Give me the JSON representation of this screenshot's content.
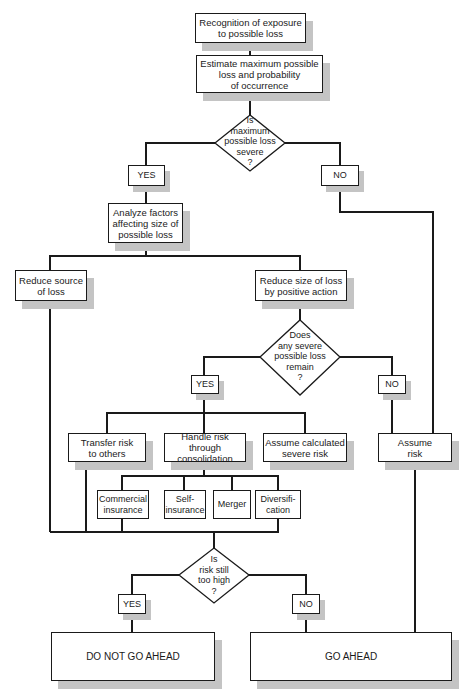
{
  "flowchart": {
    "nodes": {
      "recognition": "Recognition of exposure\nto possible loss",
      "estimate": "Estimate maximum possible\nloss and  probability\nof occurrence",
      "decision_severe": "Is\nmaximum\npossible loss\nsevere\n?",
      "yes1": "YES",
      "no1": "NO",
      "analyze": "Analyze factors\naffecting size of\npossible loss",
      "reduce_source": "Reduce source\nof loss",
      "reduce_size": "Reduce size of loss\nby positive action",
      "decision_remain": "Does\nany severe\npossible loss\nremain\n?",
      "yes2": "YES",
      "no2": "NO",
      "transfer": "Transfer risk\nto others",
      "handle": "Handle risk through\nconsolidation",
      "assume_calc": "Assume calculated\nsevere risk",
      "assume_risk": "Assume\nrisk",
      "commercial": "Commercial\ninsurance",
      "self_ins": "Self-\ninsurance",
      "merger": "Merger",
      "diversification": "Diversifi-\ncation",
      "decision_high": "Is\nrisk still\ntoo high\n?",
      "yes3": "YES",
      "no3": "NO",
      "do_not": "DO NOT GO AHEAD",
      "go_ahead": "GO AHEAD"
    },
    "colors": {
      "line": "#1a1a1a",
      "shadow": "#c4c4c4",
      "background": "#ffffff"
    }
  }
}
